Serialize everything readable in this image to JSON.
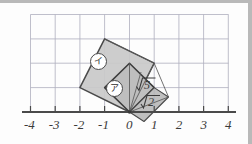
{
  "figure": {
    "background_color": "#fdfdfd",
    "page_edge_color": "#b9b9b9",
    "grid": {
      "visible": true,
      "color": "#b0b0c0",
      "cell_px": 24.6,
      "x_range": [
        -4,
        4
      ],
      "y_range": [
        0,
        4
      ],
      "origin_px": [
        129.5,
        112.0
      ]
    },
    "axis": {
      "name": "x-axis",
      "color": "#4a4a4a",
      "tick_labels": [
        "-4",
        "-3",
        "-2",
        "-1",
        "0",
        "1",
        "2",
        "3",
        "4"
      ],
      "tick_values": [
        -4,
        -3,
        -2,
        -1,
        0,
        1,
        2,
        3,
        4
      ]
    },
    "shapes": [
      {
        "name": "large-square",
        "label": "イ",
        "side_length_text": "√5",
        "vertices": [
          [
            0,
            0
          ],
          [
            -2,
            1
          ],
          [
            -1,
            3
          ],
          [
            1,
            2
          ]
        ],
        "fill": "#c9c9c9",
        "stroke": "#4a4a4a"
      },
      {
        "name": "medium-square",
        "label": "ア",
        "side_length_text": "√2",
        "vertices": [
          [
            0,
            0
          ],
          [
            1,
            1
          ],
          [
            0,
            2
          ],
          [
            -1,
            1
          ]
        ],
        "fill": "#c2c2c2",
        "stroke": "#3c3c3c"
      },
      {
        "name": "small-square",
        "label": "",
        "side_length_text": "√2",
        "vertices": [
          [
            0,
            0
          ],
          [
            1,
            1
          ],
          [
            1.6,
            0.6
          ],
          [
            0.6,
            -0.4
          ]
        ],
        "fill": "#b8b8b8",
        "stroke": "#4a4a4a"
      }
    ],
    "labels": {
      "circle_a": "ア",
      "circle_i": "イ",
      "root5": "5",
      "root2": "2",
      "radical_sign": "√"
    }
  }
}
